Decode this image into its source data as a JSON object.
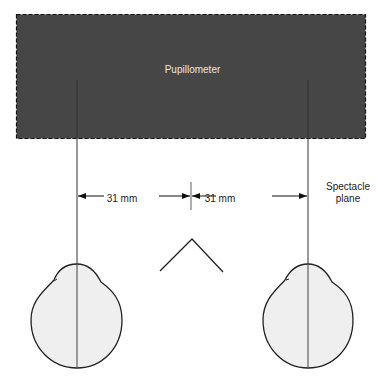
{
  "diagram": {
    "device_label": "Pupillometer",
    "distance_left": "31 mm",
    "distance_right": "31 mm",
    "plane_label_line1": "Spectacle",
    "plane_label_line2": "plane"
  },
  "colors": {
    "device_fill": "#464646",
    "eye_fill": "#efefef",
    "line": "#222222"
  },
  "elements": [
    "pupillometer",
    "left-eye",
    "right-eye",
    "nose",
    "visual-axis-left",
    "visual-axis-right",
    "center-line",
    "dimension-arrows"
  ]
}
